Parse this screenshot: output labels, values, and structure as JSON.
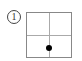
{
  "figure": {
    "label": "1",
    "grid": {
      "rows": 2,
      "cols": 2,
      "border_color": "#888888",
      "line_color": "#aaaaaa"
    },
    "point": {
      "description": "dot on vertical center line, in lower half",
      "color": "#000000",
      "position": {
        "x_fraction": 0.5,
        "y_fraction": 0.78
      }
    }
  }
}
